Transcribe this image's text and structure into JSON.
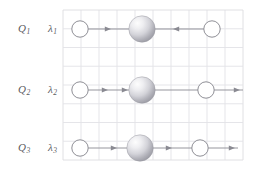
{
  "figure": {
    "background_color": "#ffffff",
    "grid": {
      "x": 63,
      "y": 10,
      "width": 180,
      "height": 150,
      "cols": 10,
      "rows": 8,
      "cell_w": 18,
      "cell_h": 18.75,
      "line_color": "#e2e2e6",
      "border_color": "#dcdce0",
      "visible": true
    },
    "palette": {
      "label_color": "#5a5a60",
      "grid_line": "#e2e2e6",
      "node_stroke": "#8f8f96",
      "node_fill": "#ffffff",
      "sphere_light": "#fbfbfb",
      "sphere_mid": "#c9c9cf",
      "sphere_dark": "#9b9ba3",
      "arrow_color": "#8a8a92"
    }
  },
  "rows": [
    {
      "id": "row-1",
      "q_label": "Q",
      "q_sub": "1",
      "lambda_label": "λ",
      "lambda_sub": "1",
      "y": 29,
      "nodes": [
        {
          "kind": "circle",
          "cx": 80,
          "r": 8.2
        },
        {
          "kind": "sphere",
          "cx": 142,
          "r": 13.2
        },
        {
          "kind": "circle",
          "cx": 212,
          "r": 8.2
        }
      ],
      "segments": [
        {
          "x1": 88,
          "x2": 129,
          "direction": "right",
          "heads": [
            107
          ]
        },
        {
          "x1": 155,
          "x2": 204,
          "direction": "left",
          "heads": [
            177
          ]
        }
      ]
    },
    {
      "id": "row-2",
      "q_label": "Q",
      "q_sub": "2",
      "lambda_label": "λ",
      "lambda_sub": "2",
      "y": 90,
      "nodes": [
        {
          "kind": "circle",
          "cx": 80,
          "r": 8.2
        },
        {
          "kind": "sphere",
          "cx": 142,
          "r": 13.2
        },
        {
          "kind": "circle",
          "cx": 206,
          "r": 8.2
        }
      ],
      "segments": [
        {
          "x1": 88,
          "x2": 129,
          "direction": "right",
          "heads": [
            104,
            124
          ]
        },
        {
          "x1": 155,
          "x2": 198,
          "direction": "right",
          "heads": []
        },
        {
          "x1": 214,
          "x2": 243,
          "direction": "right",
          "heads": [
            236
          ]
        }
      ]
    },
    {
      "id": "row-3",
      "q_label": "Q",
      "q_sub": "3",
      "lambda_label": "λ",
      "lambda_sub": "3",
      "y": 148,
      "nodes": [
        {
          "kind": "circle",
          "cx": 80,
          "r": 8.2
        },
        {
          "kind": "sphere",
          "cx": 140,
          "r": 13.2
        },
        {
          "kind": "circle",
          "cx": 200,
          "r": 8.2
        }
      ],
      "segments": [
        {
          "x1": 88,
          "x2": 127,
          "direction": "right",
          "heads": [
            113
          ]
        },
        {
          "x1": 153,
          "x2": 192,
          "direction": "right",
          "heads": [
            168
          ]
        },
        {
          "x1": 208,
          "x2": 238,
          "direction": "right",
          "heads": [
            231
          ]
        }
      ]
    }
  ]
}
